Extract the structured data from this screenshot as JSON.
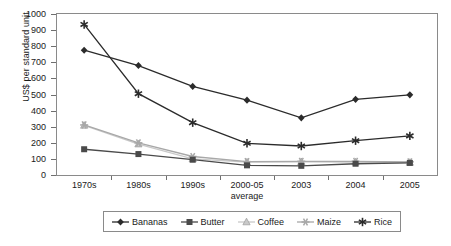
{
  "chart_data": {
    "type": "line",
    "title": "",
    "xlabel": "",
    "ylabel": "US$ per standard unit",
    "ylim": [
      0,
      1000
    ],
    "ytick_values": [
      0,
      100,
      200,
      300,
      400,
      500,
      600,
      700,
      800,
      900,
      1000
    ],
    "ytick_labels": [
      "0",
      "100",
      "200",
      "300",
      "400",
      "500",
      "600",
      "700",
      "800",
      "900",
      "1000"
    ],
    "grid": false,
    "legend_position": "bottom",
    "categories": [
      "1970s",
      "1980s",
      "1990s",
      "2000-05 average",
      "2003",
      "2004",
      "2005"
    ],
    "category_labels": [
      {
        "line1": "1970s",
        "line2": ""
      },
      {
        "line1": "1980s",
        "line2": ""
      },
      {
        "line1": "1990s",
        "line2": ""
      },
      {
        "line1": "2000-05",
        "line2": "average"
      },
      {
        "line1": "2003",
        "line2": ""
      },
      {
        "line1": "2004",
        "line2": ""
      },
      {
        "line1": "2005",
        "line2": ""
      }
    ],
    "series": [
      {
        "name": "Bananas",
        "marker": "diamond",
        "color": "#2b2b2b",
        "values": [
          775,
          680,
          550,
          465,
          355,
          470,
          498
        ]
      },
      {
        "name": "Butter",
        "marker": "square",
        "color": "#4a4a4a",
        "values": [
          160,
          130,
          95,
          60,
          57,
          70,
          75
        ]
      },
      {
        "name": "Coffee",
        "marker": "triangle",
        "color": "#c9c9c9",
        "values": [
          308,
          192,
          100,
          80,
          82,
          80,
          78
        ]
      },
      {
        "name": "Maize",
        "marker": "star",
        "color": "#a8a8a8",
        "values": [
          311,
          200,
          115,
          83,
          85,
          85,
          82
        ]
      },
      {
        "name": "Rice",
        "marker": "asterisk",
        "color": "#2b2b2b",
        "values": [
          935,
          505,
          325,
          197,
          180,
          213,
          243
        ]
      }
    ]
  },
  "legend": {
    "entries": [
      "Bananas",
      "Butter",
      "Coffee",
      "Maize",
      "Rice"
    ]
  }
}
